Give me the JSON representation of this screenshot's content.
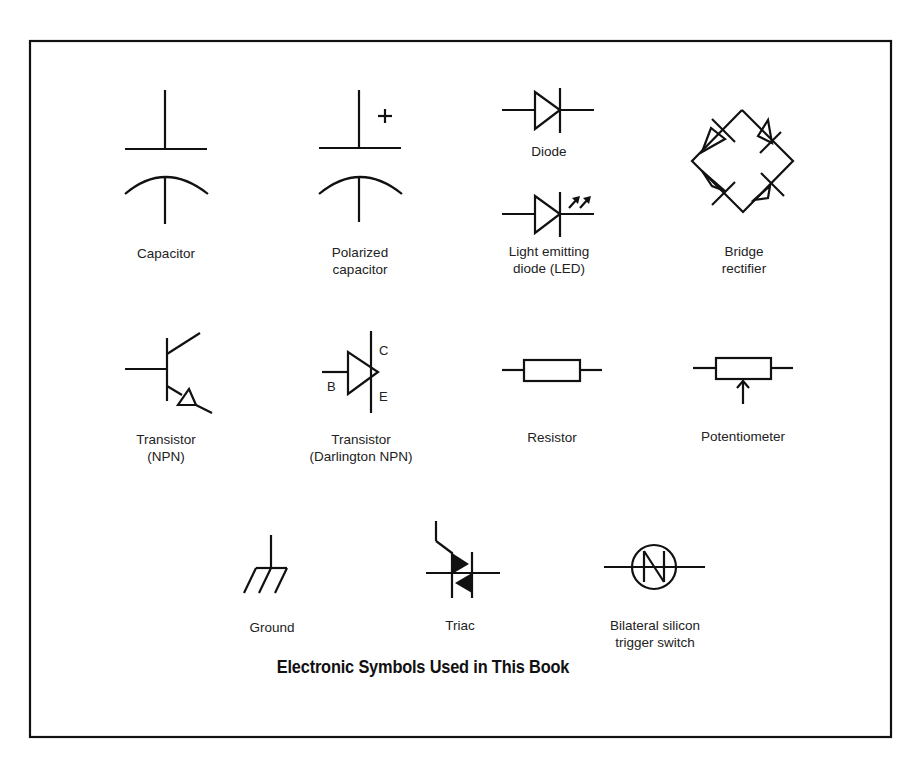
{
  "figure": {
    "title": "Electronic Symbols Used in This Book",
    "stroke_color": "#111111",
    "background": "#ffffff"
  },
  "symbols": [
    {
      "id": "capacitor",
      "label_lines": [
        "Capacitor"
      ]
    },
    {
      "id": "polarized-capacitor",
      "label_lines": [
        "Polarized",
        "capacitor"
      ],
      "marker": "+"
    },
    {
      "id": "diode",
      "label_lines": [
        "Diode"
      ]
    },
    {
      "id": "led",
      "label_lines": [
        "Light emitting",
        "diode (LED)"
      ]
    },
    {
      "id": "bridge-rectifier",
      "label_lines": [
        "Bridge",
        "rectifier"
      ]
    },
    {
      "id": "transistor-npn",
      "label_lines": [
        "Transistor",
        "(NPN)"
      ]
    },
    {
      "id": "transistor-darlington",
      "label_lines": [
        "Transistor",
        "(Darlington NPN)"
      ],
      "pins": {
        "collector": "C",
        "base": "B",
        "emitter": "E"
      }
    },
    {
      "id": "resistor",
      "label_lines": [
        "Resistor"
      ]
    },
    {
      "id": "potentiometer",
      "label_lines": [
        "Potentiometer"
      ]
    },
    {
      "id": "ground",
      "label_lines": [
        "Ground"
      ]
    },
    {
      "id": "triac",
      "label_lines": [
        "Triac"
      ]
    },
    {
      "id": "bilateral-switch",
      "label_lines": [
        "Bilateral silicon",
        "trigger switch"
      ]
    }
  ]
}
